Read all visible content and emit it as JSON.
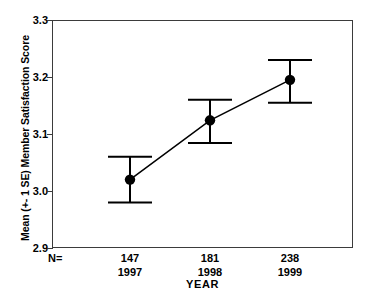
{
  "chart_data": {
    "type": "line",
    "title": "",
    "subtitle": "",
    "xlabel": "YEAR",
    "ylabel": "Mean (+- 1 SE) Member Satisfaction Score",
    "categories": [
      "1997",
      "1998",
      "1999"
    ],
    "values": [
      3.02,
      3.124,
      3.195
    ],
    "error_upper": [
      3.06,
      3.16,
      3.23
    ],
    "error_lower": [
      2.98,
      3.084,
      3.155
    ],
    "error_type": "+- 1 SE",
    "n_label": "N=",
    "n_values": [
      "147",
      "181",
      "238"
    ],
    "ylim": [
      2.9,
      3.3
    ],
    "yticks": [
      "2.9",
      "3.0",
      "3.1",
      "3.2",
      "3.3"
    ],
    "ytick_values": [
      2.9,
      3.0,
      3.1,
      3.2,
      3.3
    ],
    "grid": false,
    "legend": "none",
    "marker": "filled-circle",
    "series_color": "#000000",
    "frame_color": "#3b3b3b",
    "background": "#ffffff"
  },
  "axis": {
    "y_title": "Mean (+- 1 SE) Member Satisfaction Score",
    "x_title": "YEAR"
  },
  "yticks": {
    "t0": "2.9",
    "t1": "3.0",
    "t2": "3.1",
    "t3": "3.2",
    "t4": "3.3"
  },
  "xgroups": [
    {
      "n": "147",
      "year": "1997"
    },
    {
      "n": "181",
      "year": "1998"
    },
    {
      "n": "238",
      "year": "1999"
    }
  ],
  "n_prefix": "N="
}
